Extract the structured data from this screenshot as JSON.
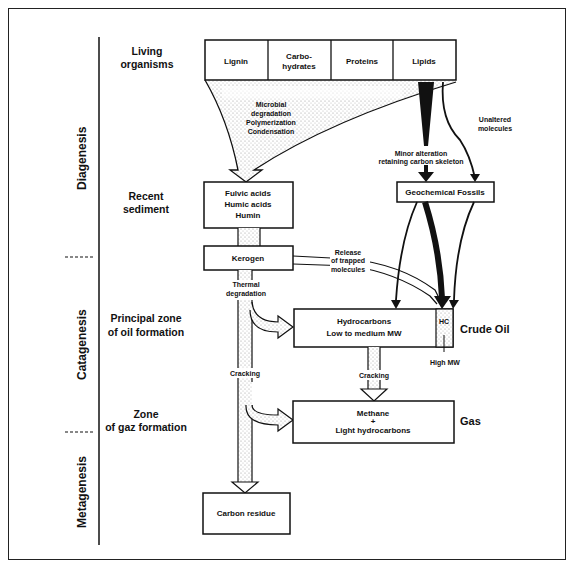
{
  "stages": {
    "diagenesis": "Diagenesis",
    "catagenesis": "Catagenesis",
    "metagenesis": "Metagenesis"
  },
  "zones": {
    "living_organisms": [
      "Living",
      "organisms"
    ],
    "recent_sediment": [
      "Recent",
      "sediment"
    ],
    "oil_formation": [
      "Principal zone",
      "of oil formation"
    ],
    "gas_formation": [
      "Zone",
      "of gaz formation"
    ]
  },
  "source_boxes": [
    {
      "label": [
        "Lignin"
      ]
    },
    {
      "label": [
        "Carbo-",
        "hydrates"
      ]
    },
    {
      "label": [
        "Proteins"
      ]
    },
    {
      "label": [
        "Lipids"
      ]
    }
  ],
  "boxes": {
    "humic": [
      "Fulvic acids",
      "Humic acids",
      "Humin"
    ],
    "geochemical_fossils": "Geochemical Fossils",
    "kerogen": "Kerogen",
    "hydrocarbons": [
      "Hydrocarbons",
      "Low to medium MW"
    ],
    "hc": "HC",
    "methane": [
      "Methane",
      "+",
      "Light hydrocarbons"
    ],
    "carbon_residue": "Carbon residue"
  },
  "process_labels": {
    "microbial": [
      "Microbial",
      "degradation",
      "Polymerization",
      "Condensation"
    ],
    "minor_alteration": [
      "Minor alteration",
      "retaining carbon skeleton"
    ],
    "unaltered": [
      "Unaltered",
      "molecules"
    ],
    "release": [
      "Release",
      "of trapped",
      "molecules"
    ],
    "thermal": [
      "Thermal",
      "degradation"
    ],
    "cracking_1": "Cracking",
    "cracking_2": "Cracking",
    "high_mw": "High MW"
  },
  "products": {
    "crude_oil": "Crude Oil",
    "gas": "Gas"
  },
  "colors": {
    "ink": "#111111",
    "stipple": "#bdbdbd",
    "background": "#ffffff"
  }
}
